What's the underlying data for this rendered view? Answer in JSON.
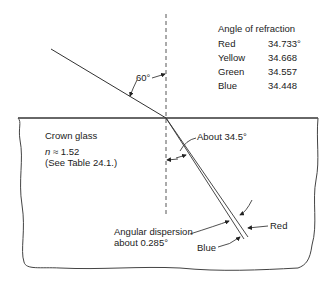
{
  "refraction_table": {
    "title": "Angle of refraction",
    "rows": [
      {
        "color": "Red",
        "angle": "34.733°"
      },
      {
        "color": "Yellow",
        "angle": "34.668"
      },
      {
        "color": "Green",
        "angle": "34.557"
      },
      {
        "color": "Blue",
        "angle": "34.448"
      }
    ]
  },
  "labels": {
    "incident_angle": "60°",
    "medium": "Crown glass",
    "n_symbol": "n",
    "n_value": "≈ 1.52",
    "table_ref": "(See Table 24.1.)",
    "refracted_angle": "About 34.5°",
    "dispersion_line1": "Angular dispersion",
    "dispersion_line2": "about 0.285°",
    "red_ray": "Red",
    "blue_ray": "Blue"
  }
}
